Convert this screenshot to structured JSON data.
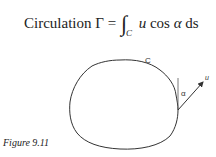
{
  "equation": {
    "label": "Circulation",
    "symbol": "Γ",
    "equals": "=",
    "integral": "∫",
    "subscript": "C",
    "integrand_u": "u",
    "integrand_cos": "cos",
    "integrand_alpha": "α",
    "integrand_ds": "ds"
  },
  "diagram": {
    "curve_label": "C",
    "angle_label": "α",
    "vector_label": "u",
    "line_color": "#333333"
  },
  "caption": {
    "text": "Figure 9.11"
  }
}
